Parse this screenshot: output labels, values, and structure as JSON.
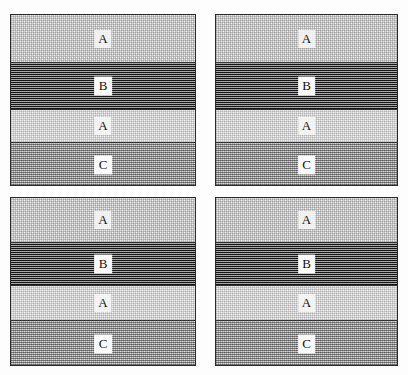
{
  "figure": {
    "name": "four-panel-layered-section-diagram",
    "panel_count": 4,
    "layout": "2x2 grid of bordered panels"
  },
  "panels": [
    {
      "id": "panel-top-left",
      "position": "top-left",
      "bands": [
        {
          "label": "A",
          "texture": "light-stipple",
          "boxed": false
        },
        {
          "label": "B",
          "texture": "dark-checker",
          "boxed": true
        },
        {
          "label": "A",
          "texture": "light-stipple",
          "boxed": false
        },
        {
          "label": "C",
          "texture": "medium-stipple",
          "boxed": true
        }
      ]
    },
    {
      "id": "panel-top-right",
      "position": "top-right",
      "bands": [
        {
          "label": "A",
          "texture": "light-stipple",
          "boxed": false
        },
        {
          "label": "B",
          "texture": "dark-checker",
          "boxed": true
        },
        {
          "label": "A",
          "texture": "light-stipple",
          "boxed": false
        },
        {
          "label": "C",
          "texture": "medium-stipple",
          "boxed": true
        }
      ]
    },
    {
      "id": "panel-bottom-left",
      "position": "bottom-left",
      "bands": [
        {
          "label": "A",
          "texture": "light-stipple",
          "boxed": false
        },
        {
          "label": "B",
          "texture": "dark-checker",
          "boxed": true
        },
        {
          "label": "A",
          "texture": "light-stipple",
          "boxed": false
        },
        {
          "label": "C",
          "texture": "medium-stipple",
          "boxed": true
        }
      ]
    },
    {
      "id": "panel-bottom-right",
      "position": "bottom-right",
      "bands": [
        {
          "label": "A",
          "texture": "light-stipple",
          "boxed": false
        },
        {
          "label": "B",
          "texture": "dark-checker",
          "boxed": true
        },
        {
          "label": "A",
          "texture": "light-stipple",
          "boxed": false
        },
        {
          "label": "C",
          "texture": "medium-stipple",
          "boxed": true
        }
      ]
    }
  ],
  "colors": {
    "border": "#2a2a2a",
    "separator": "#333333",
    "band_a_fill": "#efefef",
    "band_b_fill": "#4a4a4a",
    "band_c_fill": "#c9c9c9",
    "label_text": "#141414",
    "label_box": "#fbfbfb",
    "page_background": "#fdfdfd"
  }
}
